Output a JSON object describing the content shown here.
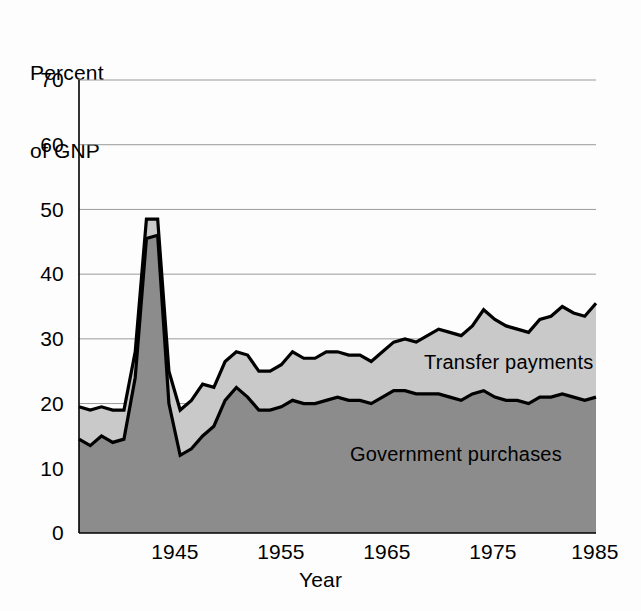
{
  "axes": {
    "ylabel_lines": [
      "Percent",
      "of GNP"
    ],
    "xlabel": "Year",
    "yticks": [
      "0",
      "10",
      "20",
      "30",
      "40",
      "50",
      "60",
      "70"
    ],
    "xticks": [
      "1945",
      "1955",
      "1965",
      "1975",
      "1985"
    ]
  },
  "labels": {
    "transfer": "Transfer payments",
    "government": "Government purchases"
  },
  "colors": {
    "government_fill": "#8c8c8c",
    "transfer_fill": "#c9c9c9",
    "outline": "#000000",
    "gridline": "#9a9a9a",
    "background": "#fdfdfd"
  },
  "chart_data": {
    "type": "area",
    "title": "",
    "subtitle": "",
    "xlabel": "Year",
    "ylabel": "Percent of GNP",
    "xlim": [
      1939,
      1985
    ],
    "ylim": [
      0,
      70
    ],
    "grid": true,
    "stacked": true,
    "legend_position": "inline-annotation",
    "annotations": [
      {
        "text": "Transfer payments",
        "x": 1968,
        "y": 26.5
      },
      {
        "text": "Government purchases",
        "x": 1962,
        "y": 12.5
      }
    ],
    "x": [
      1939,
      1940,
      1941,
      1942,
      1943,
      1944,
      1945,
      1946,
      1947,
      1948,
      1949,
      1950,
      1951,
      1952,
      1953,
      1954,
      1955,
      1956,
      1957,
      1958,
      1959,
      1960,
      1961,
      1962,
      1963,
      1964,
      1965,
      1966,
      1967,
      1968,
      1969,
      1970,
      1971,
      1972,
      1973,
      1974,
      1975,
      1976,
      1977,
      1978,
      1979,
      1980,
      1981,
      1982,
      1983,
      1984,
      1985
    ],
    "series": [
      {
        "name": "Government purchases",
        "values": [
          14.5,
          13.5,
          15.0,
          14.0,
          14.5,
          24.0,
          45.5,
          46.0,
          20.0,
          12.0,
          13.0,
          15.0,
          16.5,
          20.5,
          22.5,
          21.0,
          19.0,
          19.0,
          19.5,
          20.5,
          20.0,
          20.0,
          20.5,
          21.0,
          20.5,
          20.5,
          20.0,
          21.0,
          22.0,
          22.0,
          21.5,
          21.5,
          21.5,
          21.0,
          20.5,
          21.5,
          22.0,
          21.0,
          20.5,
          20.5,
          20.0,
          21.0,
          21.0,
          21.5,
          21.0,
          20.5,
          21.0
        ]
      },
      {
        "name": "Transfer payments",
        "values": [
          5.0,
          5.5,
          4.5,
          5.0,
          4.5,
          4.0,
          3.0,
          2.5,
          5.0,
          7.0,
          7.5,
          8.0,
          6.0,
          6.0,
          5.5,
          6.5,
          6.0,
          6.0,
          6.5,
          7.5,
          7.0,
          7.0,
          7.5,
          7.0,
          7.0,
          7.0,
          6.5,
          7.0,
          7.5,
          8.0,
          8.0,
          9.0,
          10.0,
          10.0,
          10.0,
          10.5,
          12.5,
          12.0,
          11.5,
          11.0,
          11.0,
          12.0,
          12.5,
          13.5,
          13.0,
          13.0,
          14.5
        ]
      }
    ],
    "totals": [
      19.5,
      19.0,
      19.5,
      19.0,
      19.0,
      28.0,
      48.5,
      48.5,
      25.0,
      19.0,
      20.5,
      23.0,
      22.5,
      26.5,
      28.0,
      27.5,
      25.0,
      25.0,
      26.0,
      28.0,
      27.0,
      27.0,
      28.0,
      28.0,
      27.5,
      27.5,
      26.5,
      28.0,
      29.5,
      30.0,
      29.5,
      30.5,
      31.5,
      31.0,
      30.5,
      32.0,
      34.5,
      33.0,
      32.0,
      31.5,
      31.0,
      33.0,
      33.5,
      35.0,
      34.0,
      33.5,
      35.5
    ]
  }
}
